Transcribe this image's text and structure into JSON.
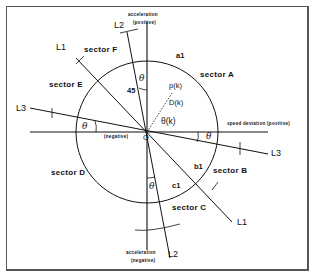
{
  "diagram": {
    "type": "sector-partition diagram",
    "colors": {
      "ink": "#111111",
      "frame": "#555555",
      "background": "#ffffff"
    },
    "axes": {
      "vertical_top": [
        "acceleration",
        "(positive)"
      ],
      "vertical_bottom": [
        "acceleration",
        "(negative)"
      ],
      "horizontal_right": "speed deviation (positive)",
      "horizontal_left": "(negative)",
      "origin": "O"
    },
    "lines": [
      "L1",
      "L2",
      "L3"
    ],
    "line_labels": {
      "l1_top": "L1",
      "l1_bottom": "L1",
      "l2_top": "L2",
      "l2_bottom": "L2",
      "l3_left": "L3",
      "l3_right": "L3"
    },
    "sectors": {
      "a": "sector A",
      "b": "sector B",
      "c": "sector C",
      "d": "sector D",
      "e": "sector E",
      "f": "sector F"
    },
    "points": {
      "a1": "a1",
      "b1": "b1",
      "c1": "c1",
      "pk": "p(k)",
      "dk": "D(k)",
      "thetak": "θ(k)"
    },
    "angles": {
      "theta": "θ",
      "deg45": "45"
    }
  }
}
